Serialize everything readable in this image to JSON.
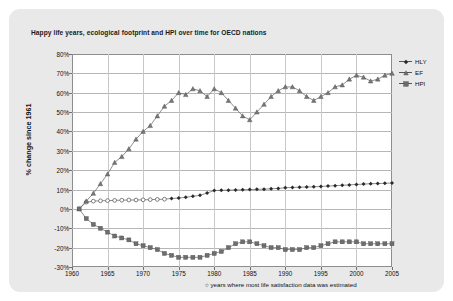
{
  "title": "Happy life years, ecological footprint and HPI over time for OECD nations",
  "footnote": "○ years where most life satisfaction data was estimated",
  "legend": [
    {
      "label": "HLY",
      "marker": "diamond",
      "color": "#2b2b2b"
    },
    {
      "label": "EF",
      "marker": "triangle",
      "color": "#707070"
    },
    {
      "label": "HPI",
      "marker": "square",
      "color": "#6a6a6a"
    }
  ],
  "chart_data": {
    "type": "line",
    "title": "Happy life years, ecological footprint and HPI over time for OECD nations",
    "xlabel": "",
    "ylabel": "% change since 1961",
    "xlim": [
      1960,
      2005
    ],
    "ylim": [
      -30,
      80
    ],
    "ytick_labels": [
      "80%",
      "70%",
      "60%",
      "50%",
      "40%",
      "30%",
      "20%",
      "10%",
      "0%",
      "-10%",
      "-20%",
      "-30%"
    ],
    "ytick_values": [
      80,
      70,
      60,
      50,
      40,
      30,
      20,
      10,
      0,
      -10,
      -20,
      -30
    ],
    "xtick_labels": [
      "1960",
      "1965",
      "1970",
      "1975",
      "1980",
      "1985",
      "1990",
      "1995",
      "2000",
      "2005"
    ],
    "xtick_values": [
      1960,
      1965,
      1970,
      1975,
      1980,
      1985,
      1990,
      1995,
      2000,
      2005
    ],
    "grid": true,
    "legend_position": "right",
    "x": [
      1961,
      1962,
      1963,
      1964,
      1965,
      1966,
      1967,
      1968,
      1969,
      1970,
      1971,
      1972,
      1973,
      1974,
      1975,
      1976,
      1977,
      1978,
      1979,
      1980,
      1981,
      1982,
      1983,
      1984,
      1985,
      1986,
      1987,
      1988,
      1989,
      1990,
      1991,
      1992,
      1993,
      1994,
      1995,
      1996,
      1997,
      1998,
      1999,
      2000,
      2001,
      2002,
      2003,
      2004,
      2005
    ],
    "series": [
      {
        "name": "HLY",
        "marker": "diamond",
        "estimated_marker": "circle",
        "estimated_until": 1973,
        "values": [
          0,
          3.5,
          4,
          4.2,
          4.3,
          4.4,
          4.5,
          4.6,
          4.6,
          4.7,
          4.8,
          4.9,
          5,
          5.4,
          5.6,
          6,
          6.5,
          7,
          8.2,
          9.5,
          9.6,
          9.7,
          9.8,
          9.9,
          10,
          10.1,
          10.2,
          10.4,
          10.6,
          10.9,
          11.1,
          11.2,
          11.3,
          11.4,
          11.6,
          11.8,
          12,
          12.2,
          12.4,
          12.6,
          12.8,
          13,
          13.1,
          13.2,
          13.4
        ]
      },
      {
        "name": "EF",
        "marker": "triangle",
        "values": [
          0,
          4,
          8,
          13,
          18,
          24,
          27,
          31,
          36,
          40,
          43,
          48,
          53,
          56,
          60,
          59,
          62,
          61,
          58,
          62,
          60,
          56,
          52,
          48,
          46,
          50,
          54,
          58,
          61,
          63,
          63,
          61,
          58,
          56,
          58,
          60,
          63,
          64,
          67,
          69,
          68,
          66,
          67,
          69,
          70
        ]
      },
      {
        "name": "HPI",
        "marker": "square",
        "values": [
          0,
          -5,
          -8,
          -10,
          -12,
          -14,
          -15,
          -16,
          -18,
          -19,
          -20,
          -21,
          -23,
          -24,
          -25,
          -25,
          -25,
          -25,
          -24,
          -23,
          -22,
          -20,
          -18,
          -17,
          -17,
          -18,
          -19,
          -20,
          -20,
          -21,
          -21,
          -21,
          -20,
          -20,
          -19,
          -18,
          -17,
          -17,
          -17,
          -17,
          -18,
          -18,
          -18,
          -18,
          -18
        ]
      }
    ]
  }
}
